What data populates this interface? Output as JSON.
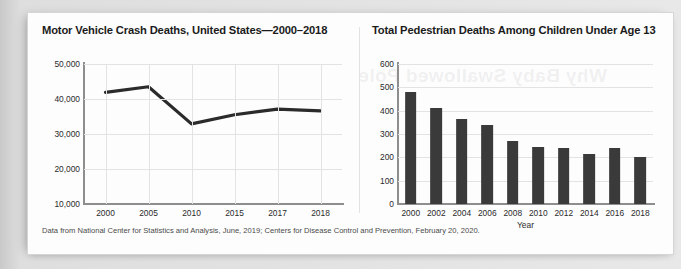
{
  "footnote": "Data from National Center for Statistics and Analysis, June, 2019; Centers for Disease Control and Prevention, February 20, 2020.",
  "bleed_text": "Why Baby Swallowed Pole",
  "chart_data": [
    {
      "type": "line",
      "title": "Motor Vehicle Crash Deaths, United States—2000–2018",
      "xlabel": "",
      "ylabel": "",
      "categories": [
        "2000",
        "2005",
        "2010",
        "2015",
        "2017",
        "2018"
      ],
      "values": [
        41900,
        43500,
        32900,
        35500,
        37100,
        36600
      ],
      "yticks": [
        "10,000",
        "20,000",
        "30,000",
        "40,000",
        "50,000"
      ],
      "ytick_values": [
        10000,
        20000,
        30000,
        40000,
        50000
      ],
      "ylim": [
        10000,
        50000
      ],
      "grid": true,
      "legend": "none",
      "line_color": "#2b2b2b"
    },
    {
      "type": "bar",
      "title": "Total Pedestrian Deaths Among Children Under Age 13",
      "xlabel": "Year",
      "ylabel": "",
      "categories": [
        "2000",
        "2002",
        "2004",
        "2006",
        "2008",
        "2010",
        "2012",
        "2014",
        "2016",
        "2018"
      ],
      "values": [
        480,
        410,
        365,
        340,
        270,
        245,
        240,
        215,
        240,
        200
      ],
      "yticks": [
        "0",
        "100",
        "200",
        "300",
        "400",
        "500",
        "600"
      ],
      "ytick_values": [
        0,
        100,
        200,
        300,
        400,
        500,
        600
      ],
      "ylim": [
        0,
        600
      ],
      "grid": true,
      "legend": "none",
      "bar_color": "#3a3a3a"
    }
  ]
}
